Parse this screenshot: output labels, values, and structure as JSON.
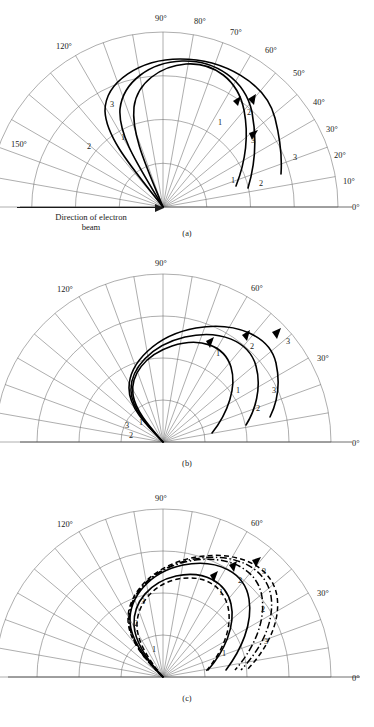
{
  "figure": {
    "beam_note_line1": "Direction of electron",
    "beam_note_line2": "beam",
    "bottom_caption": ""
  },
  "chart_data": {
    "type": "line",
    "title": "",
    "xlabel": "",
    "ylabel": "",
    "coordinate_system": "polar-half",
    "angle_range_deg": [
      0,
      180
    ],
    "grid": {
      "spokes_every_deg": 10,
      "radial_arcs": 4,
      "arc_radii_fraction": [
        0.25,
        0.5,
        0.75,
        1.0
      ]
    },
    "panels": [
      {
        "id": "a",
        "label": "(a)",
        "tick_labels": [
          "0°",
          "10°",
          "20°",
          "30°",
          "40°",
          "50°",
          "60°",
          "70°",
          "80°",
          "90°",
          "120°",
          "150°"
        ],
        "tick_angles_deg": [
          0,
          10,
          20,
          30,
          40,
          50,
          60,
          70,
          80,
          90,
          120,
          150
        ],
        "curves": [
          {
            "name": "1",
            "style": "solid",
            "labels": [
              "1",
              "1",
              "1"
            ]
          },
          {
            "name": "2",
            "style": "solid",
            "labels": [
              "2",
              "2",
              "2"
            ]
          },
          {
            "name": "3",
            "style": "solid",
            "labels": [
              "3",
              "3",
              "3"
            ]
          }
        ]
      },
      {
        "id": "b",
        "label": "(b)",
        "tick_labels": [
          "0°",
          "30°",
          "60°",
          "90°",
          "120°"
        ],
        "tick_angles_deg": [
          0,
          30,
          60,
          90,
          120
        ],
        "curves": [
          {
            "name": "1",
            "style": "solid",
            "labels": [
              "1",
              "1"
            ]
          },
          {
            "name": "2",
            "style": "solid",
            "labels": [
              "2",
              "2"
            ]
          },
          {
            "name": "3",
            "style": "solid",
            "labels": [
              "3",
              "3"
            ]
          }
        ]
      },
      {
        "id": "c",
        "label": "(c)",
        "tick_labels": [
          "0°",
          "30°",
          "60°",
          "90°",
          "120°"
        ],
        "tick_angles_deg": [
          0,
          30,
          60,
          90,
          120
        ],
        "curves": [
          {
            "name": "1",
            "style": "solid",
            "labels": [
              "1",
              "1"
            ]
          },
          {
            "name": "2",
            "style": "dashed",
            "labels": [
              "2",
              "2"
            ]
          },
          {
            "name": "3",
            "style": "dash-dot",
            "labels": [
              "3",
              "3"
            ]
          }
        ]
      }
    ]
  },
  "panel_a": {
    "caption": "(a)",
    "ticks": [
      {
        "text": "0°",
        "x": 352,
        "y": 210
      },
      {
        "text": "10°",
        "x": 343,
        "y": 184
      },
      {
        "text": "20°",
        "x": 334,
        "y": 158
      },
      {
        "text": "30°",
        "x": 326,
        "y": 132
      },
      {
        "text": "40°",
        "x": 313,
        "y": 105
      },
      {
        "text": "50°",
        "x": 293,
        "y": 76
      },
      {
        "text": "60°",
        "x": 265,
        "y": 53
      },
      {
        "text": "70°",
        "x": 230,
        "y": 35
      },
      {
        "text": "80°",
        "x": 194,
        "y": 24
      },
      {
        "text": "90°",
        "x": 155,
        "y": 21
      },
      {
        "text": "120°",
        "x": 56,
        "y": 49
      },
      {
        "text": "150°",
        "x": 11,
        "y": 147
      }
    ],
    "curve_labels": [
      {
        "text": "3",
        "x": 110,
        "y": 107
      },
      {
        "text": "1",
        "x": 121,
        "y": 140
      },
      {
        "text": "2",
        "x": 87,
        "y": 149
      },
      {
        "text": "1",
        "x": 218,
        "y": 125
      },
      {
        "text": "2",
        "x": 247,
        "y": 115
      },
      {
        "text": "3",
        "x": 251,
        "y": 143
      },
      {
        "text": "3",
        "x": 293,
        "y": 160
      },
      {
        "text": "1",
        "x": 231,
        "y": 183
      },
      {
        "text": "2",
        "x": 259,
        "y": 186
      }
    ]
  },
  "panel_b": {
    "caption": "(b)",
    "ticks": [
      {
        "text": "0°",
        "x": 352,
        "y": 201
      },
      {
        "text": "30°",
        "x": 317,
        "y": 116
      },
      {
        "text": "60°",
        "x": 251,
        "y": 46
      },
      {
        "text": "90°",
        "x": 155,
        "y": 21
      },
      {
        "text": "120°",
        "x": 57,
        "y": 47
      }
    ],
    "curve_labels": [
      {
        "text": "1",
        "x": 216,
        "y": 111
      },
      {
        "text": "2",
        "x": 250,
        "y": 104
      },
      {
        "text": "3",
        "x": 286,
        "y": 99
      },
      {
        "text": "1",
        "x": 236,
        "y": 148
      },
      {
        "text": "2",
        "x": 256,
        "y": 166
      },
      {
        "text": "3",
        "x": 272,
        "y": 148
      },
      {
        "text": "3",
        "x": 125,
        "y": 183
      },
      {
        "text": "1",
        "x": 139,
        "y": 180
      },
      {
        "text": "2",
        "x": 129,
        "y": 193
      }
    ]
  },
  "panel_c": {
    "caption": "(c)",
    "ticks": [
      {
        "text": "0°",
        "x": 352,
        "y": 201
      },
      {
        "text": "30°",
        "x": 317,
        "y": 116
      },
      {
        "text": "60°",
        "x": 251,
        "y": 46
      },
      {
        "text": "90°",
        "x": 155,
        "y": 21
      },
      {
        "text": "120°",
        "x": 57,
        "y": 47
      }
    ],
    "curve_labels": [
      {
        "text": "3",
        "x": 141,
        "y": 124
      },
      {
        "text": "2",
        "x": 134,
        "y": 146
      },
      {
        "text": "1",
        "x": 152,
        "y": 172
      },
      {
        "text": "1",
        "x": 219,
        "y": 115
      },
      {
        "text": "2",
        "x": 238,
        "y": 103
      },
      {
        "text": "3",
        "x": 262,
        "y": 94
      },
      {
        "text": "2",
        "x": 261,
        "y": 132
      },
      {
        "text": "3",
        "x": 264,
        "y": 164
      },
      {
        "text": "1",
        "x": 222,
        "y": 176
      }
    ]
  }
}
